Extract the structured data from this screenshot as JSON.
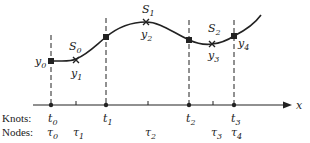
{
  "diagram": {
    "axis_label": "x",
    "row_labels": {
      "knots": "Knots:",
      "nodes": "Nodes:"
    },
    "knots": [
      {
        "name": "t",
        "sub": "0"
      },
      {
        "name": "t",
        "sub": "1"
      },
      {
        "name": "t",
        "sub": "2"
      },
      {
        "name": "t",
        "sub": "3"
      }
    ],
    "nodes": [
      {
        "name": "τ",
        "sub": "0"
      },
      {
        "name": "τ",
        "sub": "1"
      },
      {
        "name": "τ",
        "sub": "2"
      },
      {
        "name": "τ",
        "sub": "3"
      },
      {
        "name": "τ",
        "sub": "4"
      }
    ],
    "values": [
      {
        "name": "y",
        "sub": "0"
      },
      {
        "name": "y",
        "sub": "1"
      },
      {
        "name": "y",
        "sub": "2"
      },
      {
        "name": "y",
        "sub": "3"
      },
      {
        "name": "y",
        "sub": "4"
      }
    ],
    "segments": [
      {
        "name": "S",
        "sub": "0"
      },
      {
        "name": "S",
        "sub": "1"
      },
      {
        "name": "S",
        "sub": "2"
      }
    ],
    "colors": {
      "ink": "#222222",
      "background": "#ffffff"
    }
  }
}
